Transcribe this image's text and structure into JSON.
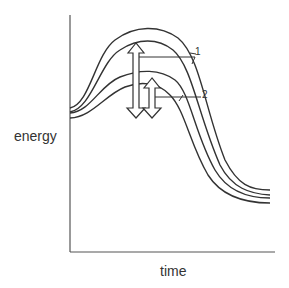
{
  "figure": {
    "type": "energy profile diagram",
    "y_axis_label": "energy",
    "x_axis_label": "time",
    "callouts": [
      {
        "id": "1",
        "label": "1",
        "points_to": "outer (higher) pair of curves / large double-headed arrow"
      },
      {
        "id": "2",
        "label": "2",
        "points_to": "inner (lower) pair of curves / small double-headed arrow"
      }
    ],
    "curves": [
      {
        "name": "upper-curve-outer"
      },
      {
        "name": "upper-curve-inner"
      },
      {
        "name": "lower-curve-outer"
      },
      {
        "name": "lower-curve-inner"
      }
    ],
    "arrows": [
      {
        "name": "arrow-1",
        "direction": "double-headed vertical"
      },
      {
        "name": "arrow-2",
        "direction": "double-headed vertical"
      }
    ],
    "colors": {
      "line": "#333333",
      "background": "#ffffff"
    }
  }
}
